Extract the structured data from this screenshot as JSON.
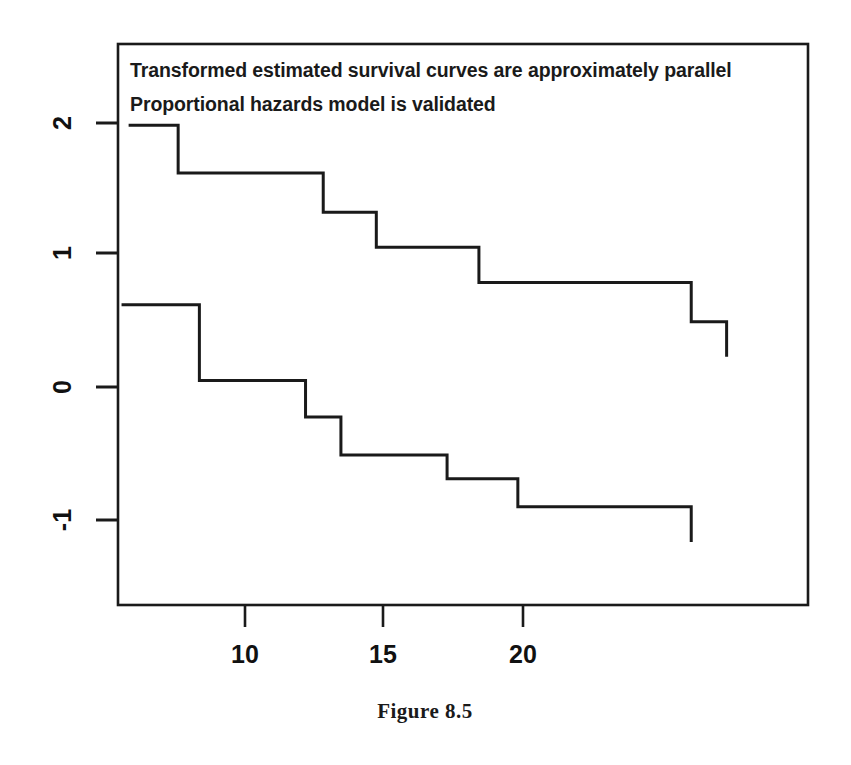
{
  "figure": {
    "caption": "Figure 8.5",
    "background_color": "#ffffff",
    "ink_color": "#1a1a1a"
  },
  "annotations": {
    "line1": "Transformed estimated survival curves are approximately parallel",
    "line2": "Proportional hazards model is validated"
  },
  "axes": {
    "x_ticks": [
      "10",
      "15",
      "20"
    ],
    "y_ticks": [
      "2",
      "1",
      "0",
      "-1"
    ],
    "x_tick_values": [
      10,
      15,
      20
    ],
    "y_tick_values": [
      2,
      1,
      0,
      -1
    ],
    "xlim": [
      5.7,
      25.2
    ],
    "ylim": [
      -1.55,
      2.45
    ],
    "frame": "box",
    "grid": false,
    "y_label_rotation": "90"
  },
  "chart_data": {
    "type": "line",
    "title": "",
    "subtitle": "",
    "xlabel": "",
    "ylabel": "",
    "xlim": [
      5.7,
      25.2
    ],
    "ylim": [
      -1.55,
      2.45
    ],
    "grid": false,
    "legend": "none",
    "line_style": "step-post",
    "annotations": [
      {
        "text": "Transformed estimated survival curves are approximately parallel",
        "x": 6.0,
        "y": 2.27
      },
      {
        "text": "Proportional hazards model is validated",
        "x": 6.0,
        "y": 1.97
      }
    ],
    "series": [
      {
        "name": "upper-curve",
        "color": "#1a1a1a",
        "line_width": 3,
        "x": [
          6.0,
          7.4,
          7.4,
          11.5,
          11.5,
          13.0,
          13.0,
          15.9,
          15.9,
          21.9,
          21.9,
          22.9,
          22.9
        ],
        "y": [
          1.87,
          1.87,
          1.53,
          1.53,
          1.25,
          1.25,
          1.0,
          1.0,
          0.75,
          0.75,
          0.47,
          0.47,
          0.22
        ]
      },
      {
        "name": "lower-curve",
        "color": "#1a1a1a",
        "line_width": 3,
        "x": [
          5.8,
          8.0,
          8.0,
          11.0,
          11.0,
          12.0,
          12.0,
          15.0,
          15.0,
          17.0,
          17.0,
          21.9,
          21.9
        ],
        "y": [
          0.59,
          0.59,
          0.05,
          0.05,
          -0.21,
          -0.21,
          -0.48,
          -0.48,
          -0.65,
          -0.65,
          -0.85,
          -0.85,
          -1.1
        ]
      }
    ]
  }
}
